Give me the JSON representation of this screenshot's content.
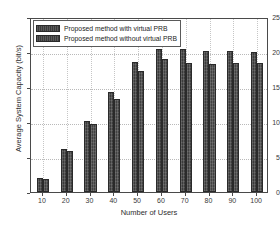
{
  "chart_data": {
    "type": "bar",
    "title": "",
    "xlabel": "Number of Users",
    "ylabel": "Average System Capacity (bit/s)",
    "categories": [
      "10",
      "20",
      "30",
      "40",
      "50",
      "60",
      "70",
      "80",
      "90",
      "100"
    ],
    "series": [
      {
        "name": "Proposed method with virtual PRB",
        "color": "#3b3b3b",
        "values": [
          2.0,
          6.1,
          10.2,
          14.3,
          18.6,
          20.4,
          20.4,
          20.1,
          20.2,
          20.0
        ]
      },
      {
        "name": "Proposed method without virtual PRB",
        "color": "#414141",
        "values": [
          1.8,
          5.9,
          9.7,
          13.3,
          17.3,
          19.0,
          18.5,
          18.3,
          18.5,
          18.5
        ]
      }
    ],
    "ylim": [
      0,
      25
    ],
    "yticks": [
      0,
      5,
      10,
      15,
      20,
      25
    ],
    "ytick_labels": [
      "0",
      "5",
      "10",
      "15",
      "20",
      "25"
    ],
    "xtick_labels": [
      "10",
      "20",
      "30",
      "40",
      "50",
      "60",
      "70",
      "80",
      "90",
      "100"
    ],
    "grid": true,
    "grid_style": "dotted",
    "legend_position": "upper-left",
    "axis_color": "#4a4a4a",
    "background": "#ffffff"
  },
  "legend": {
    "entries": [
      {
        "label": "Proposed method with virtual PRB"
      },
      {
        "label": "Proposed method without virtual PRB"
      }
    ]
  }
}
